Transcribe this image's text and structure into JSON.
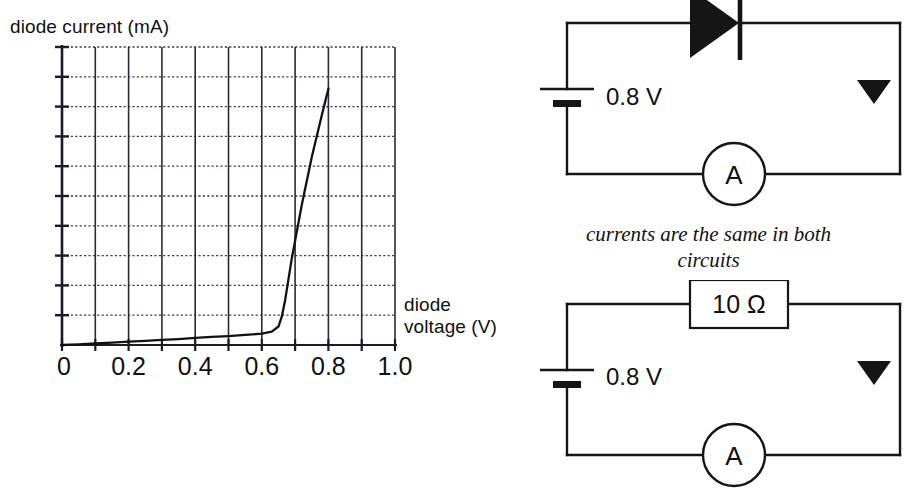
{
  "graph": {
    "y_axis_title": "diode current (mA)",
    "x_axis_title_line1": "diode",
    "x_axis_title_line2": "voltage (V)",
    "x_tick_labels": [
      "0",
      "0.2",
      "0.4",
      "0.6",
      "0.8",
      "1.0"
    ]
  },
  "chart_data": {
    "type": "line",
    "title": "",
    "xlabel": "diode voltage (V)",
    "ylabel": "diode current (mA)",
    "xlim": [
      0,
      1.0
    ],
    "ylim": [
      0,
      10
    ],
    "xticks": [
      0,
      0.2,
      0.4,
      0.6,
      0.8,
      1.0
    ],
    "xtick_labels": [
      "0",
      "0.2",
      "0.4",
      "0.6",
      "0.8",
      "1.0"
    ],
    "yticks": [
      0,
      1,
      2,
      3,
      4,
      5,
      6,
      7,
      8,
      9,
      10
    ],
    "ytick_labels": [],
    "grid": true,
    "grid_columns": 10,
    "grid_rows": 10,
    "legend": null,
    "series": [
      {
        "name": "diode I-V characteristic",
        "x": [
          0.0,
          0.05,
          0.1,
          0.15,
          0.2,
          0.25,
          0.3,
          0.35,
          0.4,
          0.45,
          0.5,
          0.55,
          0.6,
          0.63,
          0.65,
          0.66,
          0.67,
          0.68,
          0.69,
          0.7,
          0.72,
          0.75,
          0.78,
          0.8
        ],
        "y": [
          0.0,
          0.02,
          0.05,
          0.08,
          0.11,
          0.14,
          0.17,
          0.2,
          0.24,
          0.27,
          0.3,
          0.34,
          0.38,
          0.45,
          0.62,
          0.95,
          1.5,
          2.2,
          2.9,
          3.5,
          4.7,
          6.3,
          7.7,
          8.6
        ]
      }
    ]
  },
  "circuit_top": {
    "name": "diode circuit",
    "battery_label": "0.8 V",
    "meter_label": "A",
    "component": "diode"
  },
  "circuit_bottom": {
    "name": "resistor circuit",
    "battery_label": "0.8 V",
    "meter_label": "A",
    "resistor_label": "10 Ω"
  },
  "caption": {
    "line1": "currents are the same in both",
    "line2": "circuits"
  },
  "colors": {
    "ink": "#111111",
    "grid_solid": "#2a2a3a",
    "grid_dotted": "#3a3a5a",
    "background": "#ffffff"
  }
}
